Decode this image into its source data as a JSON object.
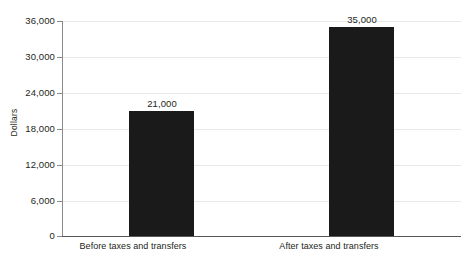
{
  "chart_data": {
    "type": "bar",
    "title": "",
    "subtitle": "",
    "xlabel": "",
    "ylabel": "Dollars",
    "categories": [
      "Before taxes and transfers",
      "After taxes and transfers"
    ],
    "values": [
      21000,
      35000
    ],
    "value_labels": [
      "21,000",
      "35,000"
    ],
    "ylim": [
      0,
      36000
    ],
    "y_ticks": [
      0,
      6000,
      12000,
      18000,
      24000,
      30000,
      36000
    ],
    "y_tick_labels": [
      "0",
      "6,000",
      "12,000",
      "18,000",
      "24,000",
      "30,000",
      "36,000"
    ],
    "grid": true,
    "legend": false,
    "orientation": "vertical",
    "bar_color": "#1a1a1a",
    "gridline_color": "#e9e9ea",
    "axis_color": "#58585b",
    "text_color": "#231f20"
  },
  "axis": {
    "y_title": "Dollars"
  },
  "ticks": {
    "t0": "36,000",
    "t1": "30,000",
    "t2": "24,000",
    "t3": "18,000",
    "t4": "12,000",
    "t5": "6,000",
    "t6": "0"
  },
  "bars": {
    "bar0": {
      "category": "Before taxes and transfers",
      "value_label": "21,000"
    },
    "bar1": {
      "category": "After taxes and transfers",
      "value_label": "35,000"
    }
  }
}
